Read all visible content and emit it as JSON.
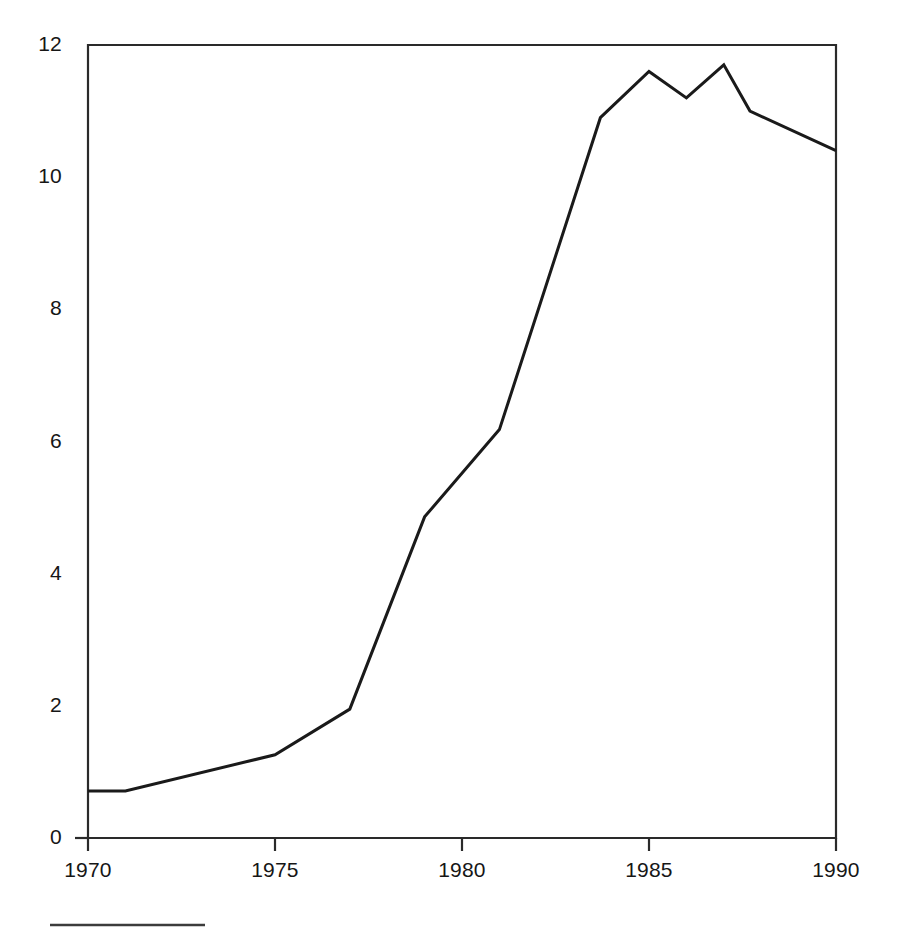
{
  "chart_data": {
    "type": "line",
    "title": "",
    "subtitle": "",
    "xlabel": "",
    "ylabel": "",
    "xlim": [
      1970,
      1990
    ],
    "ylim": [
      0,
      12
    ],
    "grid": false,
    "legend": null,
    "x_ticks": [
      "1970",
      "1975",
      "1980",
      "1985",
      "1990"
    ],
    "x_tick_values": [
      1970,
      1975,
      1980,
      1985,
      1990
    ],
    "y_ticks": [
      "0",
      "2",
      "4",
      "6",
      "8",
      "10",
      "12"
    ],
    "y_tick_values": [
      0,
      2,
      4,
      6,
      8,
      10,
      12
    ],
    "series": [
      {
        "name": "",
        "color": "#1a1a1a",
        "line_width": 3,
        "x": [
          1970,
          1971,
          1975,
          1977,
          1979,
          1981,
          1983.7,
          1985,
          1986,
          1987,
          1987.7,
          1990
        ],
        "values": [
          0.71,
          0.71,
          1.26,
          1.95,
          4.86,
          6.18,
          10.9,
          11.6,
          11.2,
          11.7,
          11.0,
          10.4
        ]
      }
    ],
    "annotations": [],
    "footer_rule": {
      "present": true,
      "color": "#3c3c3c"
    }
  }
}
